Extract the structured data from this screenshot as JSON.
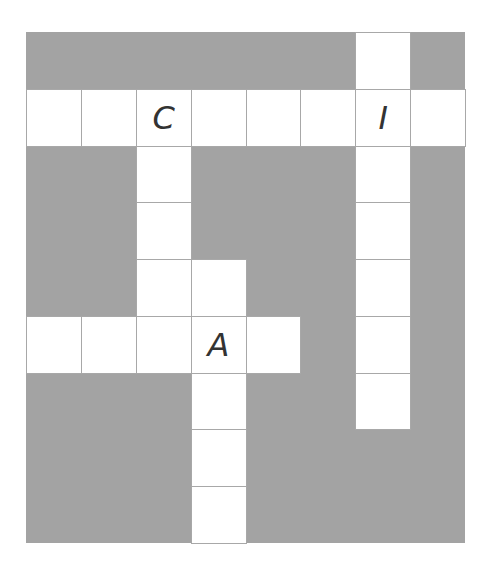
{
  "puzzle": {
    "type": "crossword",
    "rows": 9,
    "cols": 8,
    "colors": {
      "block": "#a3a3a3",
      "cell": "#ffffff",
      "border": "#a8a8a8",
      "letter": "#333333"
    },
    "cells": [
      {
        "r": 0,
        "c": 6,
        "letter": ""
      },
      {
        "r": 1,
        "c": 0,
        "letter": ""
      },
      {
        "r": 1,
        "c": 1,
        "letter": ""
      },
      {
        "r": 1,
        "c": 2,
        "letter": "C"
      },
      {
        "r": 1,
        "c": 3,
        "letter": ""
      },
      {
        "r": 1,
        "c": 4,
        "letter": ""
      },
      {
        "r": 1,
        "c": 5,
        "letter": ""
      },
      {
        "r": 1,
        "c": 6,
        "letter": "I"
      },
      {
        "r": 1,
        "c": 7,
        "letter": ""
      },
      {
        "r": 2,
        "c": 2,
        "letter": ""
      },
      {
        "r": 2,
        "c": 6,
        "letter": ""
      },
      {
        "r": 3,
        "c": 2,
        "letter": ""
      },
      {
        "r": 3,
        "c": 6,
        "letter": ""
      },
      {
        "r": 4,
        "c": 2,
        "letter": ""
      },
      {
        "r": 4,
        "c": 3,
        "letter": ""
      },
      {
        "r": 4,
        "c": 6,
        "letter": ""
      },
      {
        "r": 5,
        "c": 0,
        "letter": ""
      },
      {
        "r": 5,
        "c": 1,
        "letter": ""
      },
      {
        "r": 5,
        "c": 2,
        "letter": ""
      },
      {
        "r": 5,
        "c": 3,
        "letter": "A"
      },
      {
        "r": 5,
        "c": 4,
        "letter": ""
      },
      {
        "r": 5,
        "c": 6,
        "letter": ""
      },
      {
        "r": 6,
        "c": 3,
        "letter": ""
      },
      {
        "r": 6,
        "c": 6,
        "letter": ""
      },
      {
        "r": 7,
        "c": 3,
        "letter": ""
      },
      {
        "r": 8,
        "c": 3,
        "letter": ""
      }
    ]
  }
}
